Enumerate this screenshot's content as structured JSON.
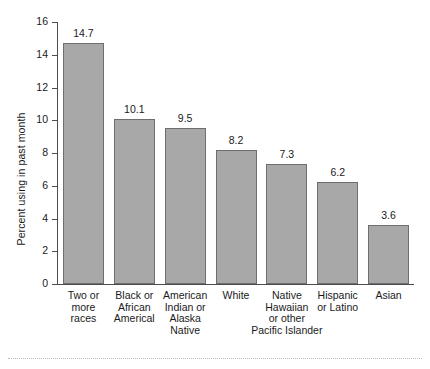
{
  "chart_data": {
    "type": "bar",
    "title": "",
    "xlabel": "",
    "ylabel": "Percent using in past month",
    "ylim": [
      0,
      16
    ],
    "yticks": [
      "0",
      "2",
      "4",
      "6",
      "8",
      "10",
      "12",
      "14",
      "16"
    ],
    "grid": false,
    "legend": "none",
    "categories": [
      "Two or\nmore\nraces",
      "Black or\nAfrican\nAmerical",
      "American\nIndian or\nAlaska\nNative",
      "White",
      "Native\nHawaiian\nor other\nPacific Islander",
      "Hispanic\nor Latino",
      "Asian"
    ],
    "values": [
      14.7,
      10.1,
      9.5,
      8.2,
      7.3,
      6.2,
      3.6
    ],
    "value_labels": [
      "14.7",
      "10.1",
      "9.5",
      "8.2",
      "7.3",
      "6.2",
      "3.6"
    ],
    "bar_color": "#a8a8a8",
    "bar_border_color": "#6e6e6e",
    "axis_color": "#4d4d4d",
    "background": "#ffffff"
  },
  "axis": {
    "y_title": "Percent using in past month"
  }
}
